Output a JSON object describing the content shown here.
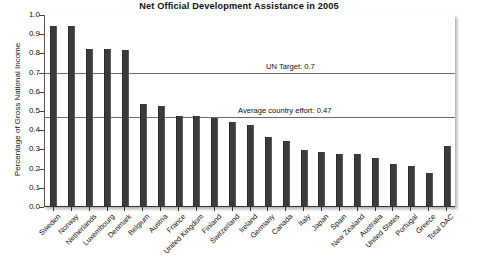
{
  "chart_data": {
    "type": "bar",
    "title": "Net Official Development Assistance in 2005",
    "xlabel": "",
    "ylabel": "Percentage of Gross National Income",
    "ylim": [
      0.0,
      1.0
    ],
    "ytick_labels": [
      "1.0",
      "0.9",
      "0.8",
      "0.7",
      "0.6",
      "0.5",
      "0.4",
      "0.3",
      "0.2",
      "0.1",
      "0.0"
    ],
    "ytick_values": [
      1.0,
      0.9,
      0.8,
      0.7,
      0.6,
      0.5,
      0.4,
      0.3,
      0.2,
      0.1,
      0.0
    ],
    "grid": false,
    "legend": "none",
    "bar_color": "#3b3b3b",
    "categories": [
      "Sweden",
      "Norway",
      "Netherlands",
      "Luxembourg",
      "Denmark",
      "Belgium",
      "Austria",
      "France",
      "United Kingdom",
      "Finland",
      "Switzerland",
      "Ireland",
      "Germany",
      "Canada",
      "Italy",
      "Japan",
      "Spain",
      "New Zealand",
      "Australia",
      "United States",
      "Portugal",
      "Greece",
      "Total DAC"
    ],
    "values": [
      0.94,
      0.94,
      0.82,
      0.82,
      0.81,
      0.53,
      0.52,
      0.47,
      0.47,
      0.46,
      0.44,
      0.42,
      0.36,
      0.34,
      0.29,
      0.28,
      0.27,
      0.27,
      0.25,
      0.22,
      0.21,
      0.17,
      0.31
    ],
    "annotations": [
      {
        "label": "UN Target: 0.7",
        "value": 0.7,
        "line_color": "#6b6b6b"
      },
      {
        "label": "Average country effort: 0.47",
        "value": 0.47,
        "line_color": "#6b6b6b"
      }
    ]
  },
  "footer": {
    "text": ""
  }
}
